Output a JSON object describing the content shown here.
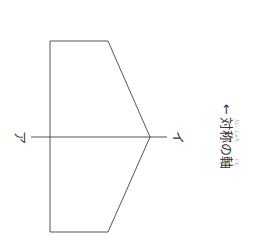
{
  "diagram": {
    "shape": {
      "type": "pentagon",
      "points": [
        [
          50,
          41
        ],
        [
          108,
          41
        ],
        [
          150,
          137
        ],
        [
          108,
          232
        ],
        [
          50,
          232
        ]
      ],
      "stroke": "#555555"
    },
    "axis_line": {
      "x1": 31,
      "y1": 137,
      "x2": 167,
      "y2": 137,
      "stroke": "#555555"
    },
    "labels": {
      "left_end": "ア",
      "right_end": "イ",
      "arrow": "←",
      "axis_words": [
        {
          "text": "対",
          "ruby": "たい"
        },
        {
          "text": "称",
          "ruby": "しょう"
        },
        {
          "text": "の",
          "ruby": ""
        },
        {
          "text": "軸",
          "ruby": "じく"
        }
      ],
      "axis_caption": "対称の軸"
    }
  }
}
